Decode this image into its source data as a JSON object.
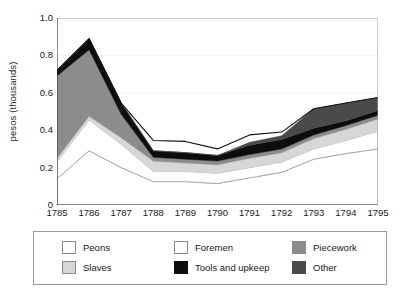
{
  "chart_data": {
    "type": "area",
    "stacked": true,
    "title": "",
    "xlabel": "",
    "ylabel": "pesos (thousands)",
    "x": [
      1785,
      1786,
      1787,
      1788,
      1789,
      1790,
      1791,
      1792,
      1793,
      1794,
      1795
    ],
    "xtick_labels": [
      "1785",
      "1786",
      "1787",
      "1788",
      "1789",
      "1790",
      "1791",
      "1792",
      "1793",
      "1794",
      "1795"
    ],
    "ytick_labels": [
      "0",
      "0.2",
      "0.4",
      "0.6",
      "0.8",
      "1.0"
    ],
    "ytick_values": [
      0,
      0.2,
      0.4,
      0.6,
      0.8,
      1.0
    ],
    "ylim": [
      0,
      1.0
    ],
    "xlim": [
      1785,
      1795
    ],
    "minor_ytick_values": [
      0.1,
      0.3,
      0.5,
      0.7,
      0.9
    ],
    "grid": "horizontal-dotted",
    "gridlines_at": [
      0.6,
      0.8
    ],
    "legend_position": "below",
    "series": [
      {
        "name": "Peons",
        "color": "#ffffff",
        "values": [
          0.14,
          0.29,
          0.2,
          0.125,
          0.125,
          0.115,
          0.145,
          0.175,
          0.245,
          0.275,
          0.3
        ]
      },
      {
        "name": "Foremen",
        "color": "#ffffff",
        "values": [
          0.09,
          0.165,
          0.125,
          0.055,
          0.055,
          0.055,
          0.055,
          0.055,
          0.055,
          0.07,
          0.095
        ]
      },
      {
        "name": "Slaves",
        "color": "#d7d7d7",
        "values": [
          0.02,
          0.02,
          0.035,
          0.055,
          0.045,
          0.045,
          0.05,
          0.05,
          0.055,
          0.06,
          0.065
        ]
      },
      {
        "name": "Piecework",
        "color": "#8c8c8c",
        "values": [
          0.44,
          0.355,
          0.125,
          0.02,
          0.02,
          0.02,
          0.02,
          0.02,
          0.02,
          0.02,
          0.02
        ]
      },
      {
        "name": "Tools and upkeep",
        "color": "#0d0d0d",
        "values": [
          0.03,
          0.06,
          0.06,
          0.035,
          0.035,
          0.03,
          0.05,
          0.05,
          0.035,
          0.025,
          0.025
        ]
      },
      {
        "name": "Other",
        "color": "#4a4a4a",
        "values": [
          0.0,
          0.0,
          0.0,
          0.0,
          0.0,
          0.0,
          0.015,
          0.02,
          0.105,
          0.095,
          0.07
        ]
      }
    ],
    "totals": [
      0.72,
      0.89,
      0.545,
      0.345,
      0.34,
      0.3,
      0.375,
      0.39,
      0.515,
      0.545,
      0.575
    ]
  },
  "legend": {
    "items": [
      {
        "label": "Peons",
        "color": "#ffffff",
        "col": 0,
        "row": 0
      },
      {
        "label": "Slaves",
        "color": "#d7d7d7",
        "col": 0,
        "row": 1
      },
      {
        "label": "Foremen",
        "color": "#ffffff",
        "col": 1,
        "row": 0
      },
      {
        "label": "Tools and upkeep",
        "color": "#0d0d0d",
        "col": 1,
        "row": 1
      },
      {
        "label": "Piecework",
        "color": "#8c8c8c",
        "col": 2,
        "row": 0
      },
      {
        "label": "Other",
        "color": "#4a4a4a",
        "col": 2,
        "row": 1
      }
    ]
  },
  "axes": {
    "frame_color": "#6b6b6b",
    "tick_color": "#4a4a4a",
    "grid_color": "#cfcfcf"
  }
}
